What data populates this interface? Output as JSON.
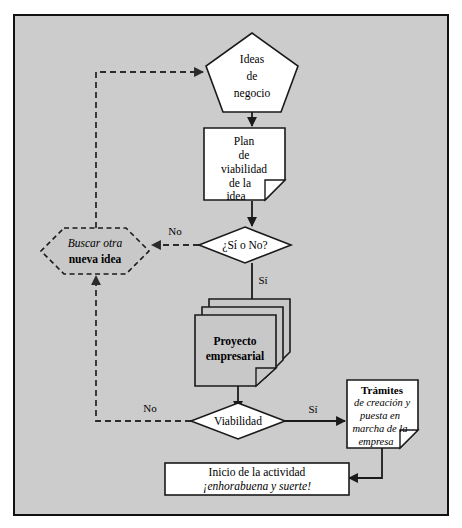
{
  "diagram": {
    "background_color": "#cccccc",
    "frame_color": "#111111",
    "shape_fill_white": "#ffffff",
    "shape_fill_gray": "#c8c8c8",
    "line_color": "#1a1a1a"
  },
  "nodes": {
    "ideas": {
      "name": "ideas-de-negocio",
      "shape": "pentagon",
      "lines": [
        "Ideas",
        "de",
        "negocio"
      ]
    },
    "plan": {
      "name": "plan-de-viabilidad",
      "shape": "document",
      "lines": [
        "Plan",
        "de",
        "viabilidad",
        "de la",
        "idea"
      ]
    },
    "decision_si_no": {
      "name": "decision-si-o-no",
      "shape": "diamond",
      "label": "¿Sí o No?"
    },
    "buscar_otra": {
      "name": "buscar-otra-nueva-idea",
      "shape": "hexagon-dashed",
      "line_italic": "Buscar otra",
      "line_bold": "nueva idea"
    },
    "proyecto": {
      "name": "proyecto-empresarial",
      "shape": "stacked-document",
      "lines": [
        "Proyecto",
        "empresarial"
      ]
    },
    "viabilidad": {
      "name": "decision-viabilidad",
      "shape": "diamond",
      "label": "Viabilidad"
    },
    "tramites": {
      "name": "tramites-creacion-puesta-en-marcha",
      "shape": "document",
      "title_bold": "Trámites",
      "lines_italic": [
        "de creación y",
        "puesta en",
        "marcha de la",
        "empresa"
      ]
    },
    "inicio": {
      "name": "inicio-de-la-actividad",
      "shape": "rectangle",
      "line_normal": "Inicio de la actividad",
      "line_italic": "¡enhorabuena y suerte!"
    }
  },
  "edge_labels": {
    "no_top": "No",
    "si_top": "Sí",
    "no_bottom": "No",
    "si_bottom": "Sí"
  }
}
